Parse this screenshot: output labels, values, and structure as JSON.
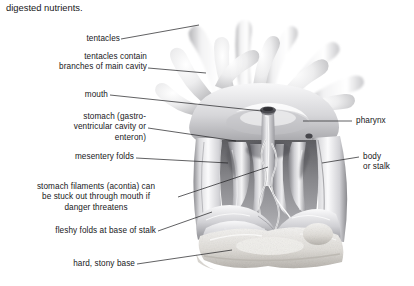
{
  "figure": {
    "caption_fragment": "digested nutrients.",
    "ink_color": "#17171a",
    "leader_color": "#1d1d20",
    "background": "#ffffff",
    "art_tones": {
      "lightest": "#fcfcfc",
      "light": "#e9e9ea",
      "mid": "#c4c4c6",
      "dark": "#9a9a9d",
      "darkest": "#6f6f73",
      "shadow": "#4b4b4f"
    }
  },
  "labels_left": [
    {
      "id": "tentacles",
      "text": "tentacles"
    },
    {
      "id": "tentacles-cavity",
      "text": "tentacles contain\nbranches of main cavity"
    },
    {
      "id": "mouth",
      "text": "mouth"
    },
    {
      "id": "stomach",
      "text": "stomach (gastro-\nventricular cavity or\nenteron)"
    },
    {
      "id": "mesentery-folds",
      "text": "mesentery folds"
    },
    {
      "id": "acontia",
      "text": "stomach filaments (acontia) can\nbe stuck out through mouth if\ndanger threatens"
    },
    {
      "id": "fleshy-folds",
      "text": "fleshy folds at base of stalk"
    },
    {
      "id": "stony-base",
      "text": "hard, stony base"
    }
  ],
  "labels_right": [
    {
      "id": "pharynx",
      "text": "pharynx"
    },
    {
      "id": "body-stalk",
      "text": "body\nor stalk"
    }
  ]
}
